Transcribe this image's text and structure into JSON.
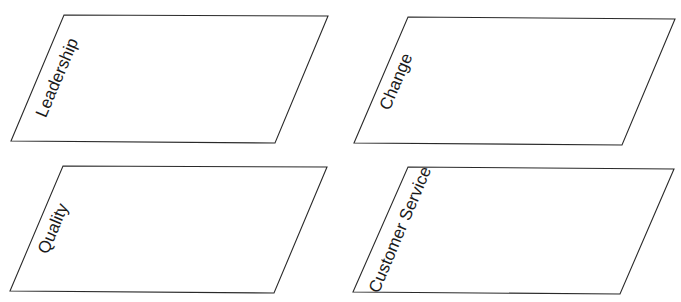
{
  "diagram": {
    "type": "quadrant-parallelograms",
    "stroke_color": "#2a2a2a",
    "text_color": "#1a1a1a",
    "background": "#ffffff",
    "label_rotation_deg": -67,
    "panels": [
      {
        "id": "leadership",
        "label": "Leadership",
        "points": "64,15 328,16 275,143 11,141",
        "label_x": 58,
        "label_y": 78
      },
      {
        "id": "change",
        "label": "Change",
        "points": "408,17 675,19 622,145 354,143",
        "label_x": 397,
        "label_y": 82
      },
      {
        "id": "quality",
        "label": "Quality",
        "points": "63,166 327,167 274,293 10,291",
        "label_x": 54,
        "label_y": 229
      },
      {
        "id": "customer-service",
        "label": "Customer Service",
        "points": "408,167 674,169 620,294 353,292",
        "label_x": 401,
        "label_y": 230
      }
    ]
  }
}
